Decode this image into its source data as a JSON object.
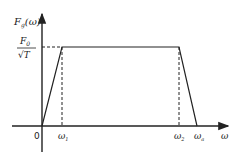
{
  "diagram": {
    "y_axis_label": "F",
    "y_axis_label_sub": "g",
    "y_axis_label_arg": "(ω)",
    "level_numerator": "F",
    "level_numerator_sub": "0",
    "level_denominator": "√T",
    "origin_label": "0",
    "x_axis_label": "ω",
    "x_ticks": [
      {
        "base": "ω",
        "sub": "1"
      },
      {
        "base": "ω",
        "sub": "2"
      },
      {
        "base": "ω",
        "sub": "a"
      }
    ],
    "line_color": "#222222"
  }
}
